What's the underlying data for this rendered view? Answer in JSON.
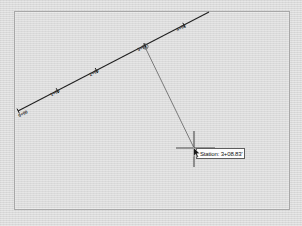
{
  "app": {
    "title": "CAD Alignment Station Readout"
  },
  "viewport": {
    "background_color": "#dcdcdc",
    "border_color": "#a8a8a8",
    "page_color": "#d9d9d9"
  },
  "alignment": {
    "name": "alignment-centerline",
    "color": "#1f1f1f",
    "start": {
      "x": 18,
      "y": 111
    },
    "end": {
      "x": 209,
      "y": 12
    },
    "stations": [
      {
        "label": "0+00",
        "x": 20,
        "y": 110
      },
      {
        "label": "1+00",
        "x": 58,
        "y": 90
      },
      {
        "label": "2+00",
        "x": 96,
        "y": 71
      },
      {
        "label": "3+00",
        "x": 145,
        "y": 46
      },
      {
        "label": "4+00",
        "x": 184,
        "y": 26
      }
    ],
    "label_rotation_deg": -27
  },
  "leader": {
    "name": "station-leader-line",
    "color": "#6e6e6e",
    "from": {
      "x": 145,
      "y": 47
    },
    "to": {
      "x": 194,
      "y": 148
    },
    "vertex_marker": {
      "x": 145,
      "y": 47,
      "r": 2.6
    }
  },
  "crosshair": {
    "name": "crosshair-cursor",
    "color": "#4a4a4a",
    "center": {
      "x": 194,
      "y": 148
    },
    "h_start": 176,
    "h_end": 215,
    "v_start": 131,
    "v_end": 167
  },
  "tooltip": {
    "name": "station-tooltip",
    "text": "Station: 3+08.83'",
    "background": "#fdfdfd",
    "border_color": "#5e5e5e",
    "text_color": "#111111"
  },
  "cursor": {
    "name": "mouse-pointer",
    "color": "#1a1a1a"
  }
}
